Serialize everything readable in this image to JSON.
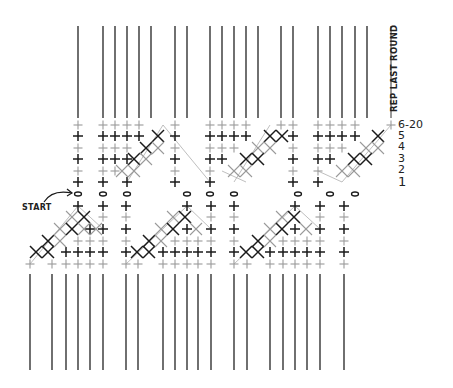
{
  "diagram": {
    "type": "crochet-stitch-chart",
    "labels": {
      "rep_last_round": "REP LAST ROUND",
      "start": "START",
      "rows": [
        {
          "label": "6-20",
          "y": 125
        },
        {
          "label": "5",
          "y": 136
        },
        {
          "label": "4",
          "y": 147
        },
        {
          "label": "3",
          "y": 159
        },
        {
          "label": "2",
          "y": 170
        },
        {
          "label": "1",
          "y": 182
        }
      ]
    },
    "legend_symbols": {
      "plus_black": "single crochet (current row, dark)",
      "plus_gray": "single crochet (alternate row, gray)",
      "x_black": "crossed stitch dark",
      "x_gray": "crossed stitch gray",
      "oval": "chain stitch",
      "line": "continued rows"
    },
    "colors": {
      "dark": "#1a1a1a",
      "gray": "#9a9a9a",
      "line": "#333333"
    },
    "top_lines": {
      "y1": 26,
      "y2": 118,
      "x": [
        78,
        103,
        115,
        127,
        139,
        151,
        175,
        187,
        210,
        222,
        234,
        246,
        258,
        281,
        293,
        318,
        330,
        342,
        355,
        367
      ],
      "rep_line_x": 391
    },
    "bottom_lines": {
      "y1": 274,
      "y2": 370,
      "x": [
        30,
        52,
        66,
        78,
        90,
        103,
        126,
        138,
        163,
        175,
        187,
        198,
        211,
        234,
        247,
        270,
        283,
        295,
        307,
        320,
        344
      ]
    },
    "chain_row": {
      "y": 194,
      "x": [
        78,
        103,
        127,
        187,
        210,
        234,
        298,
        330,
        355
      ]
    },
    "upper_stitches": [
      {
        "x": 78,
        "col": [
          "g",
          "b",
          "g",
          "b",
          "g",
          "b"
        ]
      },
      {
        "x": 103,
        "col": [
          "g",
          "b",
          "g",
          "b",
          "g",
          "b"
        ]
      },
      {
        "x": 115,
        "col": [
          "g",
          "b",
          "g",
          "b",
          "g",
          ""
        ]
      },
      {
        "x": 127,
        "col": [
          "g",
          "b",
          "g",
          "b",
          "",
          "b"
        ]
      },
      {
        "x": 139,
        "col": [
          "g",
          "b",
          "",
          "",
          "",
          ""
        ]
      },
      {
        "x": 175,
        "col": [
          "g",
          "b",
          "g",
          "b",
          "g",
          "b"
        ]
      },
      {
        "x": 210,
        "col": [
          "g",
          "b",
          "g",
          "b",
          "g",
          "b"
        ]
      },
      {
        "x": 222,
        "col": [
          "g",
          "b",
          "g",
          "b",
          "",
          ""
        ]
      },
      {
        "x": 234,
        "col": [
          "g",
          "b",
          "g",
          "",
          "",
          ""
        ]
      },
      {
        "x": 246,
        "col": [
          "g",
          "b",
          "",
          "",
          "",
          ""
        ]
      },
      {
        "x": 281,
        "col": [
          "g",
          "",
          "",
          "",
          "",
          ""
        ]
      },
      {
        "x": 293,
        "col": [
          "g",
          "b",
          "g",
          "b",
          "g",
          "b"
        ]
      },
      {
        "x": 318,
        "col": [
          "g",
          "b",
          "g",
          "b",
          "g",
          "b"
        ]
      },
      {
        "x": 330,
        "col": [
          "g",
          "b",
          "g",
          "b",
          "",
          ""
        ]
      },
      {
        "x": 342,
        "col": [
          "g",
          "b",
          "g",
          "",
          "",
          ""
        ]
      },
      {
        "x": 355,
        "col": [
          "g",
          "b",
          "",
          "",
          "",
          ""
        ]
      },
      {
        "x": 391,
        "col": [
          "g",
          "",
          "",
          "",
          "",
          ""
        ]
      }
    ],
    "upper_diagonals": [
      {
        "x0": 127,
        "y0": 182,
        "x1": 163,
        "y1": 125
      },
      {
        "x0": 210,
        "y0": 182,
        "x1": 163,
        "y1": 125
      },
      {
        "x0": 234,
        "y0": 182,
        "x1": 270,
        "y1": 125
      },
      {
        "x0": 222,
        "y0": 171,
        "x1": 246,
        "y1": 182
      },
      {
        "x0": 342,
        "y0": 182,
        "x1": 391,
        "y1": 125
      },
      {
        "x0": 318,
        "y0": 171,
        "x1": 342,
        "y1": 182
      }
    ],
    "upper_crosses": [
      {
        "x": 122,
        "y": 171,
        "c": "g"
      },
      {
        "x": 134,
        "y": 159,
        "c": "b"
      },
      {
        "x": 146,
        "y": 148,
        "c": "b"
      },
      {
        "x": 158,
        "y": 136,
        "c": "b"
      },
      {
        "x": 134,
        "y": 171,
        "c": "g"
      },
      {
        "x": 146,
        "y": 159,
        "c": "g"
      },
      {
        "x": 158,
        "y": 148,
        "c": "g"
      },
      {
        "x": 234,
        "y": 171,
        "c": "g"
      },
      {
        "x": 246,
        "y": 159,
        "c": "b"
      },
      {
        "x": 258,
        "y": 148,
        "c": "g"
      },
      {
        "x": 270,
        "y": 136,
        "c": "b"
      },
      {
        "x": 246,
        "y": 171,
        "c": "g"
      },
      {
        "x": 258,
        "y": 159,
        "c": "b"
      },
      {
        "x": 270,
        "y": 148,
        "c": "g"
      },
      {
        "x": 282,
        "y": 136,
        "c": "b"
      },
      {
        "x": 342,
        "y": 171,
        "c": "g"
      },
      {
        "x": 354,
        "y": 159,
        "c": "b"
      },
      {
        "x": 366,
        "y": 148,
        "c": "g"
      },
      {
        "x": 378,
        "y": 136,
        "c": "b"
      },
      {
        "x": 354,
        "y": 171,
        "c": "g"
      },
      {
        "x": 366,
        "y": 159,
        "c": "b"
      },
      {
        "x": 378,
        "y": 148,
        "c": "g"
      }
    ],
    "lower_stitches": [
      {
        "x": 30,
        "col": [
          "",
          "",
          "",
          "",
          "",
          "g"
        ]
      },
      {
        "x": 52,
        "col": [
          "",
          "",
          "",
          "",
          "",
          "g"
        ]
      },
      {
        "x": 66,
        "col": [
          "",
          "",
          "",
          "",
          "b",
          "g"
        ]
      },
      {
        "x": 78,
        "col": [
          "b",
          "",
          "",
          "g",
          "b",
          "g"
        ]
      },
      {
        "x": 90,
        "col": [
          "",
          "",
          "b",
          "g",
          "b",
          "g"
        ]
      },
      {
        "x": 103,
        "col": [
          "b",
          "g",
          "b",
          "g",
          "b",
          "g"
        ]
      },
      {
        "x": 126,
        "col": [
          "b",
          "g",
          "b",
          "g",
          "b",
          "g"
        ]
      },
      {
        "x": 138,
        "col": [
          "",
          "",
          "",
          "",
          "",
          "g"
        ]
      },
      {
        "x": 163,
        "col": [
          "",
          "",
          "",
          "",
          "b",
          "g"
        ]
      },
      {
        "x": 175,
        "col": [
          "",
          "",
          "",
          "g",
          "b",
          "g"
        ]
      },
      {
        "x": 187,
        "col": [
          "b",
          "",
          "b",
          "g",
          "b",
          "g"
        ]
      },
      {
        "x": 198,
        "col": [
          "",
          "",
          "",
          "g",
          "b",
          "g"
        ]
      },
      {
        "x": 211,
        "col": [
          "b",
          "g",
          "b",
          "g",
          "b",
          "g"
        ]
      },
      {
        "x": 234,
        "col": [
          "b",
          "g",
          "b",
          "g",
          "b",
          "g"
        ]
      },
      {
        "x": 247,
        "col": [
          "",
          "",
          "",
          "",
          "",
          "g"
        ]
      },
      {
        "x": 270,
        "col": [
          "",
          "",
          "",
          "",
          "b",
          "g"
        ]
      },
      {
        "x": 283,
        "col": [
          "",
          "",
          "",
          "g",
          "b",
          "g"
        ]
      },
      {
        "x": 295,
        "col": [
          "b",
          "",
          "b",
          "g",
          "b",
          "g"
        ]
      },
      {
        "x": 307,
        "col": [
          "",
          "",
          "",
          "g",
          "b",
          "g"
        ]
      },
      {
        "x": 320,
        "col": [
          "b",
          "g",
          "b",
          "g",
          "b",
          "g"
        ]
      },
      {
        "x": 344,
        "col": [
          "b",
          "g",
          "b",
          "g",
          "b",
          "g"
        ]
      }
    ],
    "lower_crosses": [
      {
        "x": 36,
        "y": 252,
        "c": "b"
      },
      {
        "x": 48,
        "y": 241,
        "c": "b"
      },
      {
        "x": 60,
        "y": 229,
        "c": "g"
      },
      {
        "x": 72,
        "y": 217,
        "c": "g"
      },
      {
        "x": 48,
        "y": 252,
        "c": "b"
      },
      {
        "x": 60,
        "y": 241,
        "c": "g"
      },
      {
        "x": 72,
        "y": 229,
        "c": "b"
      },
      {
        "x": 84,
        "y": 217,
        "c": "b"
      },
      {
        "x": 96,
        "y": 229,
        "c": "g"
      },
      {
        "x": 84,
        "y": 229,
        "c": "g"
      },
      {
        "x": 137,
        "y": 252,
        "c": "b"
      },
      {
        "x": 149,
        "y": 241,
        "c": "b"
      },
      {
        "x": 161,
        "y": 229,
        "c": "g"
      },
      {
        "x": 173,
        "y": 217,
        "c": "g"
      },
      {
        "x": 149,
        "y": 252,
        "c": "b"
      },
      {
        "x": 161,
        "y": 241,
        "c": "g"
      },
      {
        "x": 173,
        "y": 229,
        "c": "b"
      },
      {
        "x": 185,
        "y": 217,
        "c": "b"
      },
      {
        "x": 196,
        "y": 229,
        "c": "g"
      },
      {
        "x": 246,
        "y": 252,
        "c": "b"
      },
      {
        "x": 258,
        "y": 241,
        "c": "b"
      },
      {
        "x": 270,
        "y": 229,
        "c": "g"
      },
      {
        "x": 282,
        "y": 217,
        "c": "g"
      },
      {
        "x": 258,
        "y": 252,
        "c": "b"
      },
      {
        "x": 270,
        "y": 241,
        "c": "g"
      },
      {
        "x": 282,
        "y": 229,
        "c": "b"
      },
      {
        "x": 294,
        "y": 217,
        "c": "b"
      },
      {
        "x": 306,
        "y": 229,
        "c": "g"
      }
    ],
    "lower_diagonals": [
      {
        "x0": 30,
        "y0": 264,
        "x1": 78,
        "y1": 206
      },
      {
        "x0": 78,
        "y0": 206,
        "x1": 103,
        "y1": 229
      },
      {
        "x0": 126,
        "y0": 264,
        "x1": 187,
        "y1": 206
      },
      {
        "x0": 187,
        "y0": 206,
        "x1": 211,
        "y1": 229
      },
      {
        "x0": 234,
        "y0": 264,
        "x1": 295,
        "y1": 206
      },
      {
        "x0": 295,
        "y0": 206,
        "x1": 320,
        "y1": 229
      }
    ],
    "upper_rows_y": [
      125,
      136,
      148,
      159,
      171,
      182
    ],
    "lower_rows_y": [
      206,
      217,
      229,
      241,
      252,
      264
    ],
    "start_arrow": {
      "x1": 44,
      "y1": 202,
      "x2": 72,
      "y2": 193
    }
  }
}
